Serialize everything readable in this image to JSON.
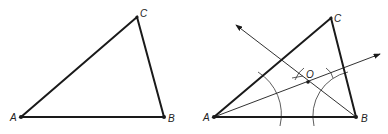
{
  "figures": [
    {
      "name": "triangle-abc",
      "vertices": {
        "A": {
          "label": "A",
          "x": 21,
          "y": 117
        },
        "B": {
          "label": "B",
          "x": 164,
          "y": 117
        },
        "C": {
          "label": "C",
          "x": 137,
          "y": 17
        }
      }
    },
    {
      "name": "triangle-abc-bisectors",
      "vertices": {
        "A": {
          "label": "A",
          "x": 214,
          "y": 117
        },
        "B": {
          "label": "B",
          "x": 356,
          "y": 117
        },
        "C": {
          "label": "C",
          "x": 331,
          "y": 18
        }
      },
      "incenter": {
        "label": "O",
        "x": 308,
        "y": 82
      }
    }
  ],
  "colors": {
    "stroke": "#1a1a1a",
    "construction": "#333333",
    "background": "#ffffff"
  }
}
